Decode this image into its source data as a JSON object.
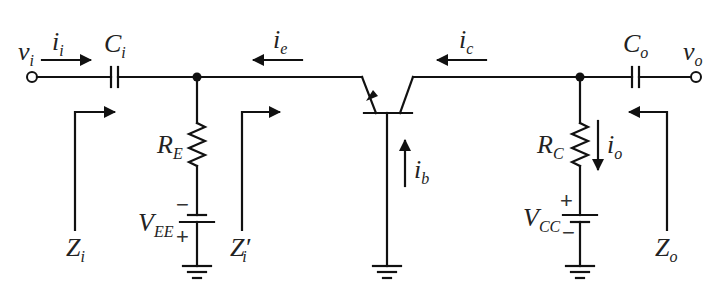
{
  "diagram": {
    "type": "common-base BJT amplifier small-signal circuit",
    "colors": {
      "wire": "#111111",
      "background": "#ffffff",
      "text": "#222222"
    },
    "terminals": {
      "input": {
        "main": "v",
        "sub": "i"
      },
      "output": {
        "main": "v",
        "sub": "o"
      }
    },
    "components": {
      "input_capacitor": {
        "main": "C",
        "sub": "i"
      },
      "output_capacitor": {
        "main": "C",
        "sub": "o"
      },
      "emitter_resistor": {
        "main": "R",
        "sub": "E"
      },
      "collector_resistor": {
        "main": "R",
        "sub": "C"
      },
      "emitter_supply": {
        "main": "V",
        "sub": "EE",
        "top_sign": "−",
        "bottom_sign": "+"
      },
      "collector_supply": {
        "main": "V",
        "sub": "CC",
        "top_sign": "+",
        "bottom_sign": "−"
      },
      "transistor": "BJT (NPN) common base"
    },
    "currents": {
      "input": {
        "main": "i",
        "sub": "i",
        "direction": "right"
      },
      "emitter": {
        "main": "i",
        "sub": "e",
        "direction": "left"
      },
      "collector": {
        "main": "i",
        "sub": "c",
        "direction": "left"
      },
      "base": {
        "main": "i",
        "sub": "b",
        "direction": "up"
      },
      "output": {
        "main": "i",
        "sub": "o",
        "direction": "down"
      }
    },
    "impedances": {
      "input": {
        "main": "Z",
        "sub": "i"
      },
      "input_prime": {
        "main": "Z",
        "prime": "′",
        "sub": "i"
      },
      "output": {
        "main": "Z",
        "sub": "o"
      }
    }
  }
}
